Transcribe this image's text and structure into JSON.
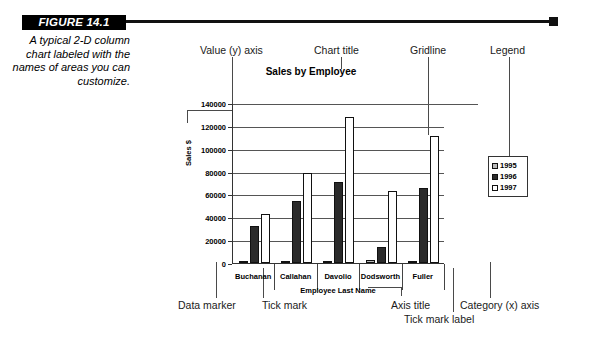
{
  "figure": {
    "badge": "FIGURE 14.1",
    "caption": "A typical 2-D column chart labeled with the names of areas you can customize."
  },
  "annotations": {
    "value_y_axis": "Value (y) axis",
    "chart_title": "Chart title",
    "gridline": "Gridline",
    "legend": "Legend",
    "data_marker": "Data marker",
    "tick_mark": "Tick mark",
    "axis_title": "Axis title",
    "category_x_axis": "Category (x) axis",
    "tick_mark_label": "Tick mark label"
  },
  "chart_data": {
    "type": "bar",
    "title": "Sales by Employee",
    "xlabel": "Employee Last Name",
    "ylabel": "Sales $",
    "categories": [
      "Buchanan",
      "Callahan",
      "Davolio",
      "Dodsworth",
      "Fuller"
    ],
    "series": [
      {
        "name": "1995",
        "values": [
          2000,
          0,
          2000,
          2500,
          0
        ],
        "color": "#b9b9b9"
      },
      {
        "name": "1996",
        "values": [
          32000,
          54000,
          71000,
          14000,
          66000
        ],
        "color": "#2b2b2b"
      },
      {
        "name": "1997",
        "values": [
          42500,
          79000,
          128000,
          63000,
          111000
        ],
        "color": "#ffffff"
      }
    ],
    "ylim": [
      0,
      140000
    ],
    "yticks": [
      0,
      20000,
      40000,
      60000,
      80000,
      100000,
      120000,
      140000
    ],
    "ytick_labels": [
      "0",
      "20000",
      "40000",
      "60000",
      "80000",
      "100000",
      "120000",
      "140000"
    ],
    "grid": true,
    "legend_position": "right",
    "legend_entries": [
      "1995",
      "1996",
      "1997"
    ]
  }
}
